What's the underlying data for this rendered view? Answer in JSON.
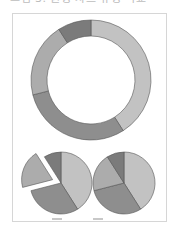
{
  "caption": "그림 3. 원형 차트 유형 비교",
  "colors": {
    "A": "#c2c2c2",
    "B": "#8e8e8e",
    "C": "#acacac",
    "D": "#7b7b7b",
    "stroke": "#555555",
    "frame": "#d6d6d6"
  },
  "chart_data": [
    {
      "type": "pie",
      "subtype": "doughnut",
      "title": "",
      "categories": [
        "A",
        "B",
        "C",
        "D"
      ],
      "values": [
        41,
        30,
        20,
        9
      ],
      "start_angle_deg": 0,
      "direction": "clockwise",
      "legend": "none",
      "data_labels": false
    },
    {
      "type": "pie",
      "subtype": "exploded",
      "title": "",
      "categories": [
        "A",
        "B",
        "C",
        "D"
      ],
      "values": [
        41,
        30,
        20,
        9
      ],
      "exploded": [
        "C"
      ],
      "start_angle_deg": 0,
      "direction": "clockwise",
      "legend": "none",
      "data_labels": false
    },
    {
      "type": "pie",
      "subtype": "standard",
      "title": "",
      "categories": [
        "A",
        "B",
        "C",
        "D"
      ],
      "values": [
        41,
        30,
        20,
        9
      ],
      "start_angle_deg": 0,
      "direction": "clockwise",
      "legend": "none",
      "data_labels": false
    }
  ]
}
